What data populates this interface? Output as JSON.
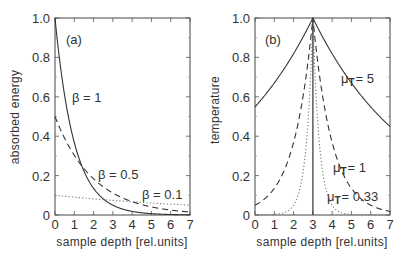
{
  "chart_data": [
    {
      "type": "line",
      "panel_label": "(a)",
      "title": "",
      "xlabel": "sample depth [rel.units]",
      "ylabel": "absorbed energy",
      "xlim": [
        0,
        7
      ],
      "ylim": [
        0,
        1.0
      ],
      "xticks": [
        "0",
        "1",
        "2",
        "3",
        "4",
        "5",
        "6",
        "7"
      ],
      "yticks": [
        "0",
        "0.2",
        "0.4",
        "0.6",
        "0.8",
        "1.0"
      ],
      "grid": false,
      "legend": "inline annotations",
      "x": [
        0,
        0.5,
        1,
        1.5,
        2,
        2.5,
        3,
        3.5,
        4,
        4.5,
        5,
        5.5,
        6,
        6.5,
        7
      ],
      "series": [
        {
          "name": "β = 1",
          "style": "solid",
          "values": [
            1.0,
            0.607,
            0.368,
            0.223,
            0.135,
            0.082,
            0.05,
            0.03,
            0.018,
            0.011,
            0.007,
            0.004,
            0.002,
            0.002,
            0.001
          ]
        },
        {
          "name": "β = 0.5",
          "style": "dashed",
          "values": [
            0.5,
            0.389,
            0.303,
            0.236,
            0.184,
            0.143,
            0.112,
            0.087,
            0.068,
            0.053,
            0.041,
            0.032,
            0.025,
            0.019,
            0.015
          ]
        },
        {
          "name": "β = 0.1",
          "style": "dotted",
          "values": [
            0.1,
            0.095,
            0.09,
            0.086,
            0.082,
            0.078,
            0.074,
            0.07,
            0.067,
            0.064,
            0.061,
            0.058,
            0.055,
            0.052,
            0.05
          ]
        }
      ],
      "annotations": [
        {
          "text": "β = 1",
          "x": 0.8,
          "y": 0.6
        },
        {
          "text": "β = 0.5",
          "x": 2.3,
          "y": 0.2
        },
        {
          "text": "β = 0.1",
          "x": 4.6,
          "y": 0.1
        }
      ]
    },
    {
      "type": "line",
      "panel_label": "(b)",
      "title": "",
      "xlabel": "sample depth [rel.units]",
      "ylabel": "temperature",
      "xlim": [
        0,
        7
      ],
      "ylim": [
        0,
        1.0
      ],
      "xticks": [
        "0",
        "1",
        "2",
        "3",
        "4",
        "5",
        "6",
        "7"
      ],
      "yticks": [
        "0",
        "0.2",
        "0.4",
        "0.6",
        "0.8",
        "1.0"
      ],
      "grid": false,
      "legend": "inline annotations",
      "vertical_line_x": 3,
      "x": [
        0,
        0.5,
        1,
        1.5,
        2,
        2.5,
        3,
        3.5,
        4,
        4.5,
        5,
        5.5,
        6,
        6.5,
        7
      ],
      "series": [
        {
          "name": "μT = 5",
          "style": "solid",
          "values": [
            0.549,
            0.607,
            0.67,
            0.741,
            0.819,
            0.905,
            1.0,
            0.905,
            0.819,
            0.741,
            0.67,
            0.607,
            0.549,
            0.497,
            0.449
          ]
        },
        {
          "name": "μT = 1",
          "style": "dashed",
          "values": [
            0.05,
            0.082,
            0.135,
            0.223,
            0.368,
            0.607,
            1.0,
            0.607,
            0.368,
            0.223,
            0.135,
            0.082,
            0.05,
            0.03,
            0.018
          ]
        },
        {
          "name": "μT = 0.33",
          "style": "dotted",
          "values": [
            0.0,
            0.001,
            0.002,
            0.011,
            0.049,
            0.221,
            1.0,
            0.221,
            0.049,
            0.011,
            0.002,
            0.001,
            0.0,
            0.0,
            0.0
          ]
        }
      ],
      "annotations": [
        {
          "text": "μT = 5",
          "x": 4.4,
          "y": 0.68
        },
        {
          "text": "μT = 1",
          "x": 4.3,
          "y": 0.2
        },
        {
          "text": "μT = 0.33",
          "x": 4.1,
          "y": 0.08
        }
      ]
    }
  ],
  "panels": {
    "a": {
      "label": "(a)",
      "ylabel": "absorbed energy",
      "xlabel": "sample depth [rel.units]",
      "labels": {
        "b1": "β = 1",
        "b05": "β = 0.5",
        "b01": "β = 0.1"
      }
    },
    "b": {
      "label": "(b)",
      "ylabel": "temperature",
      "xlabel": "sample depth [rel.units]",
      "labels": {
        "m5_mu": "μ",
        "m5_sub": "T",
        "m5_val": "= 5",
        "m1_mu": "μ",
        "m1_sub": "T",
        "m1_val": "= 1",
        "m033_mu": "μ",
        "m033_sub": "T",
        "m033_val": "= 0.33"
      }
    },
    "xticks": [
      "0",
      "1",
      "2",
      "3",
      "4",
      "5",
      "6",
      "7"
    ],
    "yticks": [
      "0",
      "0.2",
      "0.4",
      "0.6",
      "0.8",
      "1.0"
    ]
  }
}
